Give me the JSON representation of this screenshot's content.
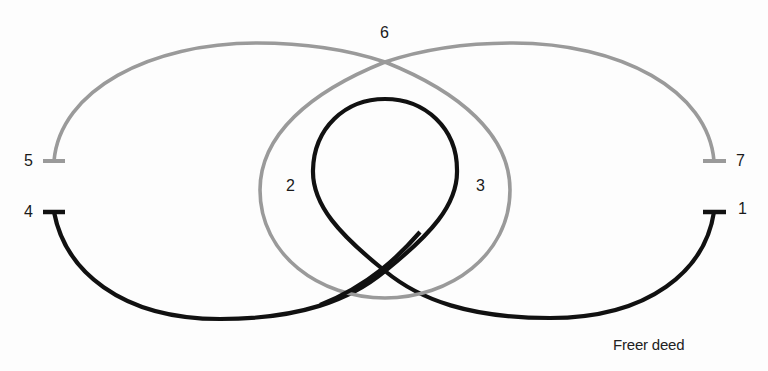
{
  "diagram": {
    "caption": "Freer deed",
    "colors": {
      "background": "#fdfdfd",
      "gray_strand": "#9a9a9a",
      "black_strand": "#111111",
      "label": "#1a1a1a"
    },
    "labels": {
      "p1": "1",
      "p2": "2",
      "p3": "3",
      "p4": "4",
      "p5": "5",
      "p6": "6",
      "p7": "7"
    },
    "strands": [
      {
        "name": "gray-strand",
        "color": "gray",
        "from": "5",
        "to": "7",
        "via": [
          "6",
          "2",
          "3"
        ]
      },
      {
        "name": "black-strand",
        "color": "black",
        "from": "1",
        "to": "4",
        "via": [
          "3",
          "2"
        ]
      }
    ]
  }
}
